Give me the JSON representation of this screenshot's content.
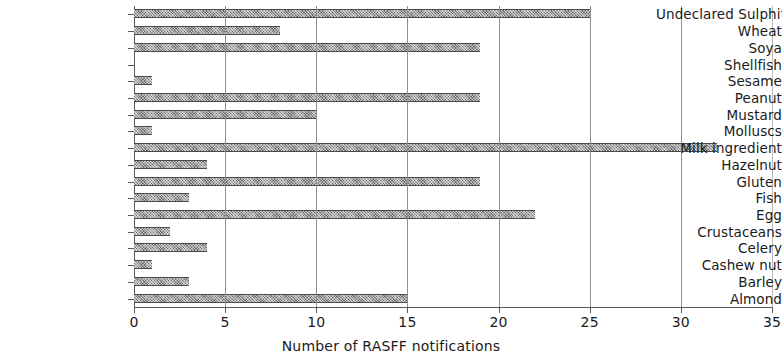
{
  "chart_data": {
    "type": "bar",
    "orientation": "horizontal",
    "title": "",
    "subtitle": "",
    "xlabel": "Number of RASFF notifications",
    "ylabel": "",
    "xlim": [
      0,
      35
    ],
    "ylim": null,
    "grid": true,
    "gridlines_axis": "x",
    "legend": null,
    "legend_position": "none",
    "xticks": [
      0,
      5,
      10,
      15,
      20,
      25,
      30,
      35
    ],
    "xtick_labels": [
      "0",
      "5",
      "10",
      "15",
      "20",
      "25",
      "30",
      "35"
    ],
    "categories": [
      "Undeclared Sulphite",
      "Wheat",
      "Soya",
      "Shellfish",
      "Sesame",
      "Peanut",
      "Mustard",
      "Molluscs",
      "Milk ingredient",
      "Hazelnut",
      "Gluten",
      "Fish",
      "Egg",
      "Crustaceans",
      "Celery",
      "Cashew nut",
      "Barley",
      "Almond"
    ],
    "values": [
      25,
      8,
      19,
      0,
      1,
      19,
      10,
      1,
      32,
      4,
      19,
      3,
      22,
      2,
      4,
      1,
      3,
      15
    ],
    "bar_color": "#6b6b6b",
    "bar_pattern": "cross-hatch"
  },
  "axis": {
    "x_title": "Number of RASFF notifications"
  },
  "colors": {
    "bar_fill": "#6b6b6b",
    "bar_edge": "#4a4a4a",
    "gridline": "#8f8f8f",
    "axis": "#5a5a5a",
    "text": "#1a1a1a",
    "background": "#ffffff"
  }
}
